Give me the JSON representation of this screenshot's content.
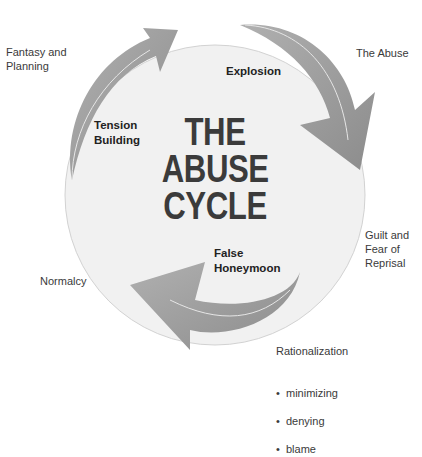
{
  "title": {
    "line1": "THE",
    "line2": "ABUSE",
    "line3": "CYCLE"
  },
  "stages": {
    "tension": "Tension\nBuilding",
    "explosion": "Explosion",
    "honeymoon": "False\nHoneymoon"
  },
  "transitions": {
    "fantasy": "Fantasy and\nPlanning",
    "abuse": "The Abuse",
    "guilt": "Guilt and\nFear of\nReprisal",
    "normalcy": "Normalcy",
    "rationalization": {
      "heading": "Rationalization",
      "items": [
        "minimizing",
        "denying",
        "blame"
      ]
    }
  },
  "colors": {
    "circle_fill": "#f1f1f1",
    "circle_stroke": "#d0d0d0",
    "arrow_fill": "#9a9a9a",
    "arrow_dark": "#7d7d7d",
    "title_text": "#3b3b3b"
  }
}
